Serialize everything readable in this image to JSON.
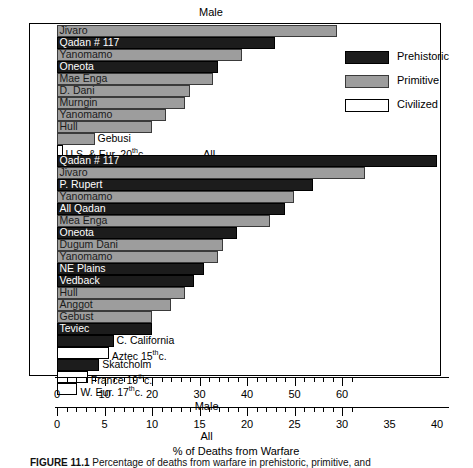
{
  "figure": {
    "caption_label": "FIGURE 11.1",
    "caption_text": "Percentage of deaths from warfare in prehistoric, primitive, and"
  },
  "legend": {
    "position": "top-right",
    "items": [
      {
        "label": "Prehistoric",
        "color": "#1c1c1c"
      },
      {
        "label": "Primitive",
        "color": "#9d9d9d"
      },
      {
        "label": "Civilized",
        "color": "#ffffff"
      }
    ]
  },
  "sections": {
    "male_title": "Male",
    "all_title": "All"
  },
  "axes": {
    "male": {
      "name": "Male",
      "ticks": [
        0,
        10,
        20,
        30,
        40,
        50,
        60
      ],
      "min": 0,
      "max": 63
    },
    "all": {
      "name": "All",
      "ticks": [
        0,
        5,
        10,
        15,
        20,
        25,
        30,
        35,
        40
      ],
      "min": 0,
      "max": 31.5
    },
    "xlabel": "% of Deaths from Warfare"
  },
  "chart_data": {
    "type": "bar",
    "orientation": "horizontal",
    "title": "% of Deaths from Warfare",
    "xlabel": "% of Deaths from Warfare",
    "ylabel": "",
    "grid": false,
    "legend_position": "top-right",
    "scales": {
      "male": {
        "label": "Male",
        "ticks": [
          0,
          10,
          20,
          30,
          40,
          50,
          60
        ],
        "range": [
          0,
          63
        ]
      },
      "all": {
        "label": "All",
        "ticks": [
          0,
          5,
          10,
          15,
          20,
          25,
          30,
          35,
          40
        ],
        "range": [
          0,
          31.5
        ]
      }
    },
    "groups": [
      {
        "name": "Male",
        "scale": "male",
        "bars": [
          {
            "label": "Jivaro",
            "value": 59.0,
            "category": "Primitive",
            "label_placement": "inside"
          },
          {
            "label": "Qadan # 117",
            "value": 46.0,
            "category": "Prehistoric",
            "label_placement": "inside"
          },
          {
            "label": "Yanomamo",
            "value": 39.0,
            "category": "Primitive",
            "label_placement": "inside"
          },
          {
            "label": "Oneota",
            "value": 34.0,
            "category": "Prehistoric",
            "label_placement": "inside"
          },
          {
            "label": "Mae Enga",
            "value": 33.0,
            "category": "Primitive",
            "label_placement": "inside"
          },
          {
            "label": "D. Dani",
            "value": 28.0,
            "category": "Primitive",
            "label_placement": "inside"
          },
          {
            "label": "Murngin",
            "value": 27.0,
            "category": "Primitive",
            "label_placement": "inside"
          },
          {
            "label": "Yanomamo",
            "value": 23.0,
            "category": "Primitive",
            "label_placement": "inside"
          },
          {
            "label": "Hull",
            "value": 20.0,
            "category": "Primitive",
            "label_placement": "inside"
          },
          {
            "label": "Gebusi",
            "value": 8.0,
            "category": "Primitive",
            "label_placement": "outside"
          },
          {
            "label": "U.S. & Eur. 20thc.",
            "value": 1.0,
            "category": "Civilized",
            "label_placement": "outside",
            "label_main": "U.S. & Eur. 20",
            "label_sup": "th",
            "label_tail": "c."
          }
        ]
      },
      {
        "name": "All",
        "scale": "all",
        "bars": [
          {
            "label": "Qadan # 117",
            "value": 40.0,
            "category": "Prehistoric",
            "label_placement": "inside"
          },
          {
            "label": "Jivaro",
            "value": 32.5,
            "category": "Primitive",
            "label_placement": "inside"
          },
          {
            "label": "P. Rupert",
            "value": 27.0,
            "category": "Prehistoric",
            "label_placement": "inside"
          },
          {
            "label": "Yanomamo",
            "value": 25.0,
            "category": "Primitive",
            "label_placement": "inside"
          },
          {
            "label": "All Qadan",
            "value": 24.0,
            "category": "Prehistoric",
            "label_placement": "inside"
          },
          {
            "label": "Mea Enga",
            "value": 22.5,
            "category": "Primitive",
            "label_placement": "inside"
          },
          {
            "label": "Oneota",
            "value": 19.0,
            "category": "Prehistoric",
            "label_placement": "inside"
          },
          {
            "label": "Dugum Dani",
            "value": 17.5,
            "category": "Primitive",
            "label_placement": "inside"
          },
          {
            "label": "Yanomamo",
            "value": 17.0,
            "category": "Primitive",
            "label_placement": "inside"
          },
          {
            "label": "NE Plains",
            "value": 15.5,
            "category": "Prehistoric",
            "label_placement": "inside"
          },
          {
            "label": "Vedback",
            "value": 14.5,
            "category": "Prehistoric",
            "label_placement": "inside"
          },
          {
            "label": "Hull",
            "value": 13.5,
            "category": "Primitive",
            "label_placement": "inside"
          },
          {
            "label": "Anggot",
            "value": 12.0,
            "category": "Primitive",
            "label_placement": "inside"
          },
          {
            "label": "Gebust",
            "value": 10.0,
            "category": "Primitive",
            "label_placement": "inside"
          },
          {
            "label": "Teviec",
            "value": 10.0,
            "category": "Prehistoric",
            "label_placement": "inside"
          },
          {
            "label": "C. California",
            "value": 6.0,
            "category": "Prehistoric",
            "label_placement": "outside"
          },
          {
            "label": "Aztec 15thc.",
            "value": 5.5,
            "category": "Civilized",
            "label_placement": "outside",
            "label_main": "Aztec 15",
            "label_sup": "th",
            "label_tail": "c."
          },
          {
            "label": "Skatcholm",
            "value": 4.5,
            "category": "Prehistoric",
            "label_placement": "outside"
          },
          {
            "label": "France 19thc.",
            "value": 3.3,
            "category": "Civilized",
            "label_placement": "outside",
            "label_main": "France 19",
            "label_sup": "th",
            "label_tail": "c."
          },
          {
            "label": "W. Eur. 17thc.",
            "value": 2.2,
            "category": "Civilized",
            "label_placement": "outside",
            "label_main": "W. Eur. 17",
            "label_sup": "th",
            "label_tail": "c."
          }
        ]
      }
    ]
  }
}
